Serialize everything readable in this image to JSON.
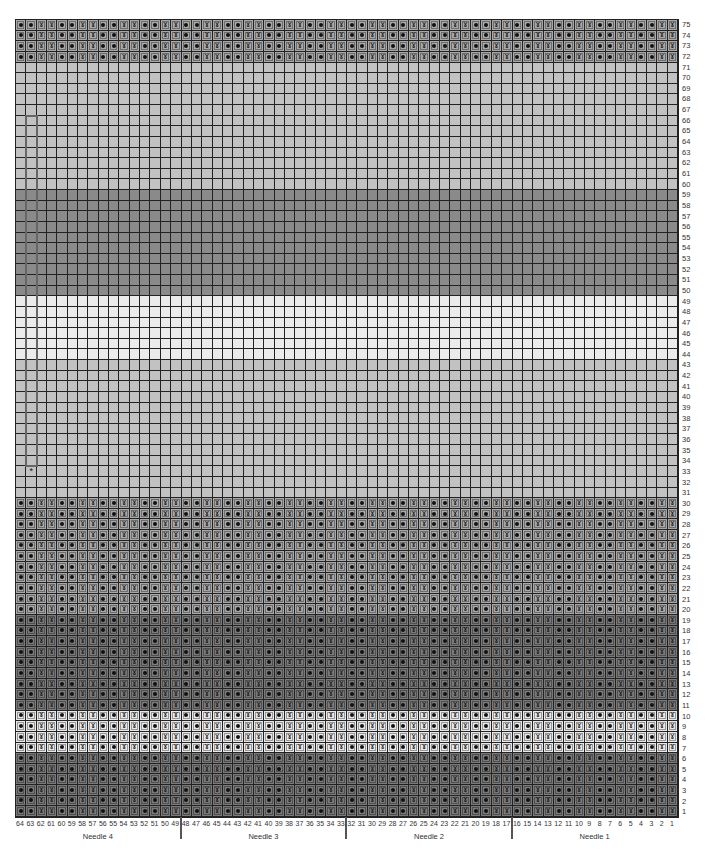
{
  "chart": {
    "title": "",
    "columns": 64,
    "rows": 75,
    "column_numbering": "right-to-left, 64 on left to 1 on right",
    "row_numbering": "bottom-to-top, 1 at bottom to 75 at top",
    "stitch_pattern": {
      "repeat_width": 4,
      "description": "columns where (col-1) mod 4 is 0 or 1 show twisted stitch; others show purl dot",
      "twist_symbol": "ꝺ",
      "dot_symbol": "•"
    },
    "stitch_rows": [
      [
        1,
        30
      ],
      [
        72,
        75
      ]
    ],
    "color_bands": [
      {
        "rows": [
          1,
          6
        ],
        "color": "#7a7a7a",
        "name": "dark gray"
      },
      {
        "rows": [
          7,
          10
        ],
        "color": "#e8e8e8",
        "name": "white"
      },
      {
        "rows": [
          11,
          19
        ],
        "color": "#7a7a7a",
        "name": "dark gray"
      },
      {
        "rows": [
          20,
          30
        ],
        "color": "#a8a8a8",
        "name": "medium gray"
      },
      {
        "rows": [
          31,
          43
        ],
        "color": "#c2c2c2",
        "name": "light gray"
      },
      {
        "rows": [
          44,
          49
        ],
        "color": "#ebebeb",
        "name": "white"
      },
      {
        "rows": [
          50,
          59
        ],
        "color": "#8a8a8a",
        "name": "dark gray"
      },
      {
        "rows": [
          60,
          71
        ],
        "color": "#c2c2c2",
        "name": "light gray"
      },
      {
        "rows": [
          72,
          75
        ],
        "color": "#a8a8a8",
        "name": "medium gray"
      }
    ],
    "marker": {
      "column": 63,
      "row_from": 34,
      "row_to": 66,
      "asterisk_row": 33,
      "asterisk_col": 63,
      "asterisk": "*"
    },
    "needles": [
      {
        "label": "Needle 4",
        "cols": [
          49,
          64
        ]
      },
      {
        "label": "Needle 3",
        "cols": [
          33,
          48
        ]
      },
      {
        "label": "Needle 2",
        "cols": [
          17,
          32
        ]
      },
      {
        "label": "Needle 1",
        "cols": [
          1,
          16
        ]
      }
    ],
    "needle_dividers_after_cols": [
      49,
      33,
      17
    ]
  }
}
